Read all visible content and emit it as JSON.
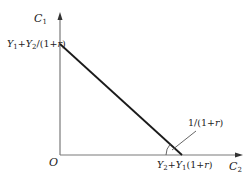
{
  "diagram": {
    "type": "intertemporal-budget-constraint",
    "axes": {
      "y_axis_label": {
        "main": "C",
        "sub": "1"
      },
      "x_axis_label": {
        "main": "C",
        "sub": "2"
      },
      "origin_label": "O"
    },
    "y_intercept_label": {
      "parts": [
        "Y",
        "1",
        "+",
        "Y",
        "2",
        "/(1+",
        "r",
        ")"
      ]
    },
    "x_intercept_label": {
      "parts": [
        "Y",
        "2",
        "+",
        "Y",
        "1",
        "(1+",
        "r",
        ")"
      ]
    },
    "slope_label": {
      "parts": [
        "1/(1+",
        "r",
        ")"
      ]
    },
    "colors": {
      "axis": "#7a7a7a",
      "budget_line": "#1a1a1a",
      "text": "#222222"
    }
  }
}
